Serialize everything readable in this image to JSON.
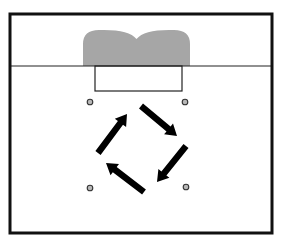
{
  "diagram": {
    "title": "",
    "colors": {
      "background": "#ffffff",
      "border": "#111111",
      "line": "#222222",
      "goal_area_fill": "#a6a6a6",
      "cone_fill": "#b8b8b8",
      "cone_stroke": "#333333",
      "arrow": "#000000"
    },
    "field": {
      "x": 10,
      "y": 14,
      "width": 262,
      "height": 219,
      "border_width": 3
    },
    "goal_line": {
      "y": 66,
      "x1": 10,
      "x2": 272
    },
    "goal_area_shape": {
      "x_left": 83,
      "x_right": 190,
      "top": 30,
      "bottom": 66,
      "label": ""
    },
    "goal_box": {
      "x": 95,
      "y": 66,
      "width": 87,
      "height": 25
    },
    "cones": [
      {
        "name": "cone-top-left",
        "cx": 90,
        "cy": 102
      },
      {
        "name": "cone-top-right",
        "cx": 185,
        "cy": 102
      },
      {
        "name": "cone-bottom-left",
        "cx": 90,
        "cy": 188
      },
      {
        "name": "cone-bottom-right",
        "cx": 186,
        "cy": 187
      }
    ],
    "arrows": [
      {
        "name": "arrow-down-right",
        "x1": 141,
        "y1": 106,
        "x2": 177,
        "y2": 136
      },
      {
        "name": "arrow-down-left",
        "x1": 186,
        "y1": 146,
        "x2": 157,
        "y2": 182
      },
      {
        "name": "arrow-up-left",
        "x1": 144,
        "y1": 192,
        "x2": 106,
        "y2": 163
      },
      {
        "name": "arrow-up-right",
        "x1": 98,
        "y1": 153,
        "x2": 127,
        "y2": 114
      }
    ]
  }
}
